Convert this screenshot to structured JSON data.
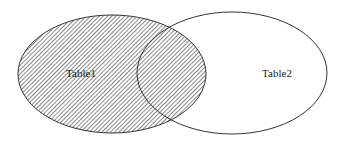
{
  "diagram": {
    "type": "venn",
    "sets": [
      {
        "label": "Table1",
        "shaded": true
      },
      {
        "label": "Table2",
        "shaded": false
      }
    ],
    "shaded_region": "Table1 (entire left set, including intersection)",
    "colors": {
      "stroke": "#333333",
      "hatch": "#555555",
      "background": "#ffffff"
    }
  }
}
